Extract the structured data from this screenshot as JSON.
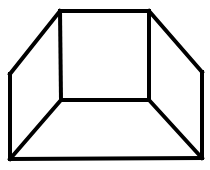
{
  "figure": {
    "stroke_color": "#000000",
    "background": "#ffffff",
    "vertices": {
      "inner_top_left": [
        60,
        11
      ],
      "inner_top_right": [
        149,
        11
      ],
      "inner_bottom_right": [
        149,
        100
      ],
      "inner_bottom_left": [
        61,
        100
      ],
      "outer_left_top": [
        10,
        74
      ],
      "outer_right_top": [
        202,
        72
      ],
      "outer_bottom_left": [
        10,
        159
      ],
      "outer_bottom_right": [
        202,
        158
      ]
    },
    "edges": [
      [
        "inner_top_left",
        "inner_top_right"
      ],
      [
        "inner_top_right",
        "inner_bottom_right"
      ],
      [
        "inner_bottom_right",
        "inner_bottom_left"
      ],
      [
        "inner_bottom_left",
        "inner_top_left"
      ],
      [
        "inner_top_left",
        "outer_left_top"
      ],
      [
        "outer_left_top",
        "outer_bottom_left"
      ],
      [
        "outer_bottom_left",
        "outer_bottom_right"
      ],
      [
        "outer_bottom_right",
        "outer_right_top"
      ],
      [
        "outer_right_top",
        "inner_top_right"
      ],
      [
        "inner_bottom_left",
        "outer_bottom_left"
      ],
      [
        "inner_bottom_right",
        "outer_bottom_right"
      ]
    ]
  }
}
